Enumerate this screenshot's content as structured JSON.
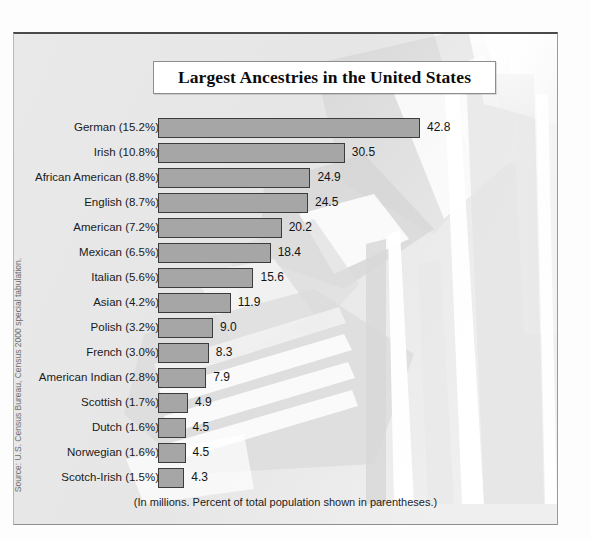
{
  "frame": {
    "background_color": "#e9e9e9",
    "border_color": "#4a4a4a"
  },
  "title": {
    "text": "Largest Ancestries in the United States"
  },
  "caption": {
    "text": "(In millions. Percent of total population shown in parentheses.)"
  },
  "source": {
    "text": "Source: U.S. Census Bureau, Census 2000 special tabulation."
  },
  "colors": {
    "bar_fill": "#a6a6a6",
    "bar_border": "#3c3c3c",
    "text": "#1a1a1a",
    "plaque": "#ffffff"
  },
  "chart_data": {
    "type": "bar",
    "orientation": "horizontal",
    "title": "Largest Ancestries in the United States",
    "subtitle": "(In millions. Percent of total population shown in parentheses.)",
    "xlabel": "",
    "ylabel": "",
    "xlim": [
      0,
      42.8
    ],
    "grid": false,
    "legend": "none",
    "value_unit": "millions",
    "categories": [
      "German (15.2%)",
      "Irish (10.8%)",
      "African American (8.8%)",
      "English (8.7%)",
      "American (7.2%)",
      "Mexican (6.5%)",
      "Italian (5.6%)",
      "Asian (4.2%)",
      "Polish (3.2%)",
      "French (3.0%)",
      "American Indian (2.8%)",
      "Scottish (1.7%)",
      "Dutch (1.6%)",
      "Norwegian (1.6%)",
      "Scotch-Irish (1.5%)"
    ],
    "values": [
      42.8,
      30.5,
      24.9,
      24.5,
      20.2,
      18.4,
      15.6,
      11.9,
      9.0,
      8.3,
      7.9,
      4.9,
      4.5,
      4.5,
      4.3
    ],
    "value_labels": [
      "42.8",
      "30.5",
      "24.9",
      "24.5",
      "20.2",
      "18.4",
      "15.6",
      "11.9",
      "9.0",
      "8.3",
      "7.9",
      "4.9",
      "4.5",
      "4.5",
      "4.3"
    ],
    "percent_of_population": [
      15.2,
      10.8,
      8.8,
      8.7,
      7.2,
      6.5,
      5.6,
      4.2,
      3.2,
      3.0,
      2.8,
      1.7,
      1.6,
      1.6,
      1.5
    ],
    "ancestry_names": [
      "German",
      "Irish",
      "African American",
      "English",
      "American",
      "Mexican",
      "Italian",
      "Asian",
      "Polish",
      "French",
      "American Indian",
      "Scottish",
      "Dutch",
      "Norwegian",
      "Scotch-Irish"
    ]
  }
}
